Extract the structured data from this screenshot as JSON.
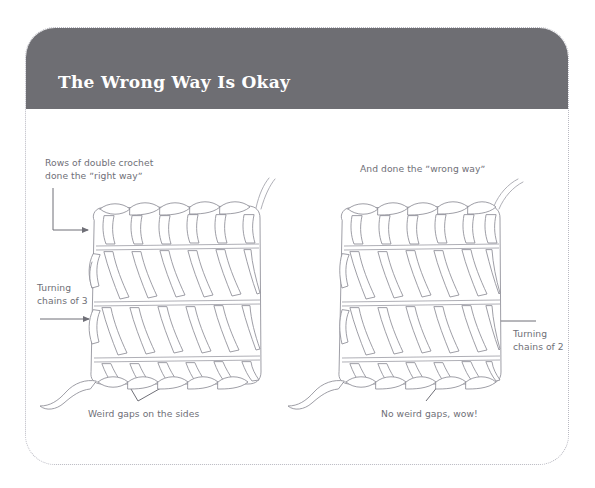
{
  "page": {
    "background_color": "#ffffff",
    "card": {
      "border_style": "dotted",
      "border_color": "#b9b9c2",
      "corner_radius_px": 30
    }
  },
  "header": {
    "title": "The Wrong Way Is Okay",
    "background_color": "#6e6e73",
    "text_color": "#ffffff"
  },
  "figure": {
    "annotation_color": "#6f6f77",
    "left_swatch": {
      "name": "double-crochet-right-way-swatch",
      "top_label_line1": "Rows of double crochet",
      "top_label_line2": "done the ˮright wayˮ",
      "side_label_line1": "Turning",
      "side_label_line2": "chains of 3",
      "bottom_label": "Weird gaps on the sides"
    },
    "right_swatch": {
      "name": "double-crochet-wrong-way-swatch",
      "top_label": "And done the ˮwrong wayˮ",
      "side_label_line1": "Turning",
      "side_label_line2": "chains of 2",
      "bottom_label": "No weird gaps, wow!"
    }
  }
}
